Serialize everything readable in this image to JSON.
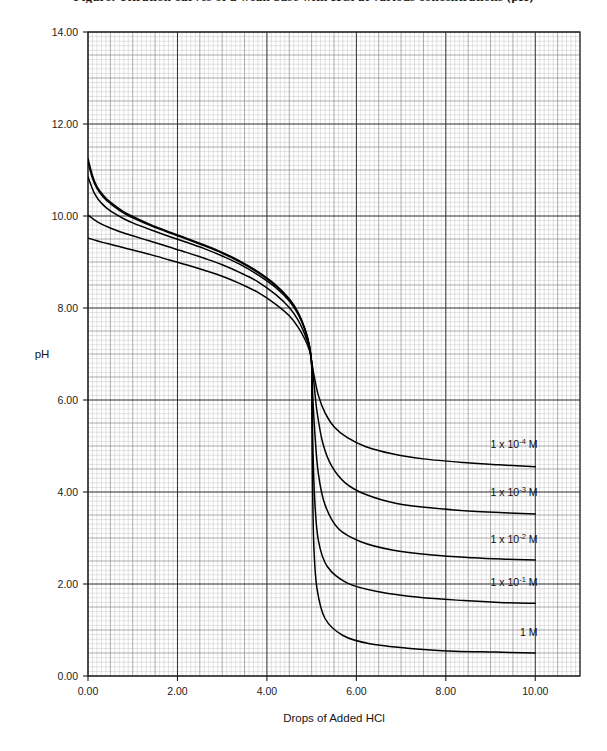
{
  "caption": {
    "text": "Figure: Titration curves of a weak base with HCl at various concentrations (pH)"
  },
  "chart_data": {
    "type": "line",
    "title": "",
    "subtitle": "",
    "xlabel": "Drops of Added HCl",
    "ylabel": "pH",
    "xlim": [
      0,
      11
    ],
    "ylim": [
      0,
      14
    ],
    "xticks": [
      "0.00",
      "2.00",
      "4.00",
      "6.00",
      "8.00",
      "10.00"
    ],
    "xtick_values": [
      0,
      2,
      4,
      6,
      8,
      10
    ],
    "yticks": [
      "0.00",
      "2.00",
      "4.00",
      "6.00",
      "8.00",
      "10.00",
      "12.00",
      "14.00"
    ],
    "ytick_values": [
      0,
      2,
      4,
      6,
      8,
      10,
      12,
      14
    ],
    "grid": true,
    "grid_minor_step_x": 0.1,
    "grid_minor_step_y": 0.1,
    "grid_mid_step_x": 0.5,
    "grid_mid_step_y": 0.5,
    "grid_major_step_x": 2.0,
    "grid_major_step_y": 2.0,
    "legend_position": "inline-right",
    "line_color": "#000000",
    "grid_color_minor": "#c9c9c9",
    "grid_color_mid": "#8a8a8a",
    "grid_color_major": "#2b2b2b",
    "equivalence_point_x": 5.0,
    "equivalence_point_ph": 7.0,
    "series": [
      {
        "name": "1 x 10-4 M",
        "label_mantissa": "1 x 10",
        "label_exponent": "-4",
        "label_unit": " M",
        "label_x": 10.05,
        "label_y": 4.95,
        "start_ph": 9.52,
        "end_ph": 4.55,
        "points": [
          [
            0.0,
            9.52
          ],
          [
            0.2,
            9.46
          ],
          [
            0.4,
            9.41
          ],
          [
            0.6,
            9.36
          ],
          [
            0.8,
            9.31
          ],
          [
            1.0,
            9.26
          ],
          [
            1.4,
            9.16
          ],
          [
            1.8,
            9.05
          ],
          [
            2.2,
            8.94
          ],
          [
            2.6,
            8.82
          ],
          [
            3.0,
            8.69
          ],
          [
            3.4,
            8.53
          ],
          [
            3.8,
            8.34
          ],
          [
            4.2,
            8.08
          ],
          [
            4.5,
            7.83
          ],
          [
            4.7,
            7.58
          ],
          [
            4.85,
            7.32
          ],
          [
            4.95,
            7.08
          ],
          [
            5.0,
            6.85
          ],
          [
            5.05,
            6.55
          ],
          [
            5.15,
            6.1
          ],
          [
            5.3,
            5.72
          ],
          [
            5.5,
            5.42
          ],
          [
            5.8,
            5.18
          ],
          [
            6.2,
            4.99
          ],
          [
            6.8,
            4.83
          ],
          [
            7.5,
            4.72
          ],
          [
            8.4,
            4.64
          ],
          [
            9.2,
            4.59
          ],
          [
            10.0,
            4.55
          ]
        ]
      },
      {
        "name": "1 x 10-3 M",
        "label_mantissa": "1 x 10",
        "label_exponent": "-3",
        "label_unit": " M",
        "label_x": 10.05,
        "label_y": 3.92,
        "start_ph": 10.02,
        "end_ph": 3.52,
        "points": [
          [
            0.0,
            10.02
          ],
          [
            0.2,
            9.88
          ],
          [
            0.4,
            9.78
          ],
          [
            0.6,
            9.7
          ],
          [
            0.8,
            9.63
          ],
          [
            1.0,
            9.57
          ],
          [
            1.4,
            9.45
          ],
          [
            1.8,
            9.33
          ],
          [
            2.2,
            9.21
          ],
          [
            2.6,
            9.08
          ],
          [
            3.0,
            8.94
          ],
          [
            3.4,
            8.77
          ],
          [
            3.8,
            8.57
          ],
          [
            4.2,
            8.29
          ],
          [
            4.5,
            8.01
          ],
          [
            4.7,
            7.73
          ],
          [
            4.85,
            7.42
          ],
          [
            4.95,
            7.13
          ],
          [
            5.0,
            6.82
          ],
          [
            5.05,
            6.38
          ],
          [
            5.12,
            5.75
          ],
          [
            5.25,
            5.06
          ],
          [
            5.45,
            4.56
          ],
          [
            5.75,
            4.2
          ],
          [
            6.2,
            3.95
          ],
          [
            6.9,
            3.75
          ],
          [
            7.7,
            3.65
          ],
          [
            8.6,
            3.58
          ],
          [
            9.3,
            3.55
          ],
          [
            10.0,
            3.52
          ]
        ]
      },
      {
        "name": "1 x 10-2 M",
        "label_mantissa": "1 x 10",
        "label_exponent": "-2",
        "label_unit": " M",
        "label_x": 10.05,
        "label_y": 2.9,
        "start_ph": 10.85,
        "end_ph": 2.52,
        "points": [
          [
            0.0,
            10.85
          ],
          [
            0.15,
            10.48
          ],
          [
            0.3,
            10.28
          ],
          [
            0.5,
            10.11
          ],
          [
            0.8,
            9.94
          ],
          [
            1.0,
            9.85
          ],
          [
            1.4,
            9.7
          ],
          [
            1.8,
            9.56
          ],
          [
            2.2,
            9.43
          ],
          [
            2.6,
            9.29
          ],
          [
            3.0,
            9.13
          ],
          [
            3.4,
            8.95
          ],
          [
            3.8,
            8.72
          ],
          [
            4.2,
            8.44
          ],
          [
            4.5,
            8.15
          ],
          [
            4.7,
            7.86
          ],
          [
            4.85,
            7.52
          ],
          [
            4.95,
            7.17
          ],
          [
            5.0,
            6.8
          ],
          [
            5.02,
            6.2
          ],
          [
            5.07,
            5.3
          ],
          [
            5.15,
            4.4
          ],
          [
            5.3,
            3.72
          ],
          [
            5.6,
            3.2
          ],
          [
            6.1,
            2.92
          ],
          [
            6.8,
            2.74
          ],
          [
            7.7,
            2.63
          ],
          [
            8.6,
            2.57
          ],
          [
            9.3,
            2.54
          ],
          [
            10.0,
            2.52
          ]
        ]
      },
      {
        "name": "1 x 10-1 M",
        "label_mantissa": "1 x 10",
        "label_exponent": "-1",
        "label_unit": " M",
        "label_x": 10.05,
        "label_y": 1.95,
        "start_ph": 11.18,
        "end_ph": 1.58,
        "points": [
          [
            0.0,
            11.18
          ],
          [
            0.1,
            10.82
          ],
          [
            0.2,
            10.6
          ],
          [
            0.35,
            10.4
          ],
          [
            0.5,
            10.27
          ],
          [
            0.8,
            10.06
          ],
          [
            1.0,
            9.96
          ],
          [
            1.4,
            9.79
          ],
          [
            1.8,
            9.64
          ],
          [
            2.2,
            9.5
          ],
          [
            2.6,
            9.35
          ],
          [
            3.0,
            9.19
          ],
          [
            3.4,
            9.0
          ],
          [
            3.8,
            8.77
          ],
          [
            4.2,
            8.48
          ],
          [
            4.5,
            8.18
          ],
          [
            4.7,
            7.88
          ],
          [
            4.85,
            7.54
          ],
          [
            4.95,
            7.18
          ],
          [
            5.0,
            6.78
          ],
          [
            5.01,
            6.05
          ],
          [
            5.03,
            4.9
          ],
          [
            5.07,
            3.8
          ],
          [
            5.15,
            2.95
          ],
          [
            5.35,
            2.38
          ],
          [
            5.8,
            2.02
          ],
          [
            6.5,
            1.83
          ],
          [
            7.4,
            1.71
          ],
          [
            8.4,
            1.64
          ],
          [
            9.2,
            1.6
          ],
          [
            10.0,
            1.58
          ]
        ]
      },
      {
        "name": "1 M",
        "label_mantissa": "1 M",
        "label_exponent": "",
        "label_unit": "",
        "label_x": 10.05,
        "label_y": 0.88,
        "start_ph": 11.25,
        "end_ph": 0.5,
        "points": [
          [
            0.0,
            11.25
          ],
          [
            0.1,
            10.88
          ],
          [
            0.2,
            10.64
          ],
          [
            0.35,
            10.44
          ],
          [
            0.5,
            10.3
          ],
          [
            0.8,
            10.09
          ],
          [
            1.0,
            9.99
          ],
          [
            1.4,
            9.81
          ],
          [
            1.8,
            9.66
          ],
          [
            2.2,
            9.52
          ],
          [
            2.6,
            9.37
          ],
          [
            3.0,
            9.21
          ],
          [
            3.4,
            9.02
          ],
          [
            3.8,
            8.79
          ],
          [
            4.2,
            8.5
          ],
          [
            4.5,
            8.2
          ],
          [
            4.7,
            7.9
          ],
          [
            4.85,
            7.55
          ],
          [
            4.95,
            7.18
          ],
          [
            5.0,
            6.75
          ],
          [
            5.005,
            5.8
          ],
          [
            5.02,
            4.2
          ],
          [
            5.05,
            2.8
          ],
          [
            5.12,
            1.9
          ],
          [
            5.3,
            1.25
          ],
          [
            5.7,
            0.88
          ],
          [
            6.3,
            0.7
          ],
          [
            7.2,
            0.6
          ],
          [
            8.2,
            0.54
          ],
          [
            9.1,
            0.52
          ],
          [
            10.0,
            0.5
          ]
        ]
      }
    ]
  }
}
